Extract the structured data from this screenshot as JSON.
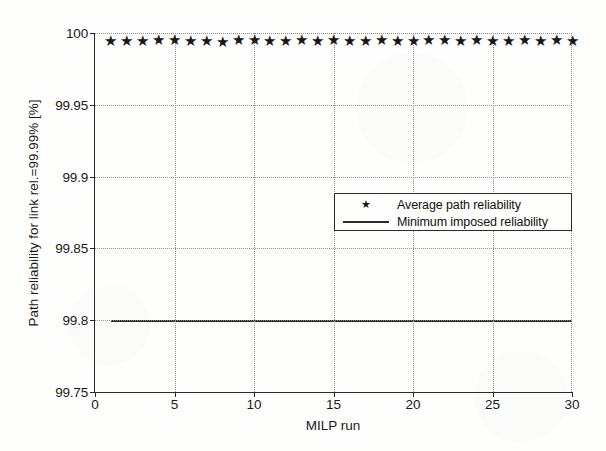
{
  "chart_data": {
    "type": "scatter",
    "title": "",
    "xlabel": "MILP run",
    "ylabel": "Path reliability for link rel.=99.99% [%]",
    "xlim": [
      0,
      30
    ],
    "ylim": [
      99.75,
      100
    ],
    "xticks": [
      0,
      5,
      10,
      15,
      20,
      25,
      30
    ],
    "xtick_labels": [
      "0",
      "5",
      "10",
      "15",
      "20",
      "25",
      "30"
    ],
    "yticks": [
      99.75,
      99.8,
      99.85,
      99.9,
      99.95,
      100
    ],
    "ytick_labels": [
      "99.75",
      "99.8",
      "99.85",
      "99.9",
      "99.95",
      "100"
    ],
    "grid": true,
    "grid_style": "dotted",
    "legend_position": "center-right",
    "series": [
      {
        "name": "Average path reliability",
        "marker": "star",
        "style": "markers",
        "x": [
          1,
          2,
          3,
          4,
          5,
          6,
          7,
          8,
          9,
          10,
          11,
          12,
          13,
          14,
          15,
          16,
          17,
          18,
          19,
          20,
          21,
          22,
          23,
          24,
          25,
          26,
          27,
          28,
          29,
          30
        ],
        "values": [
          99.9952,
          99.9953,
          99.9948,
          99.9961,
          99.9956,
          99.9954,
          99.995,
          99.9946,
          99.9959,
          99.9957,
          99.9951,
          99.9953,
          99.9955,
          99.9952,
          99.996,
          99.9954,
          99.9951,
          99.9956,
          99.9953,
          99.9949,
          99.9955,
          99.9958,
          99.9952,
          99.9961,
          99.9954,
          99.995,
          99.9957,
          99.9953,
          99.9955,
          99.9951
        ]
      },
      {
        "name": "Minimum imposed reliability",
        "marker": "none",
        "style": "line",
        "x": [
          1,
          30
        ],
        "values": [
          99.8,
          99.8
        ]
      }
    ]
  },
  "legend": {
    "entries": [
      {
        "label": "Average path reliability",
        "key": "star-marker",
        "glyph": "★"
      },
      {
        "label": "Minimum imposed reliability",
        "key": "solid-line",
        "glyph": ""
      }
    ]
  },
  "colors": {
    "background": "#fefefc",
    "axis": "#2b2b2b",
    "grid": "#8e8e8e",
    "marker": "#181818",
    "threshold_line": "#2a2a2a",
    "text": "#1a1a1a"
  }
}
